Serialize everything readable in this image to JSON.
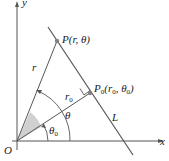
{
  "diagram": {
    "colors": {
      "line": "#555555",
      "point": "#808080",
      "shade": "#d0d0d0",
      "text": "#222222"
    },
    "axes": {
      "x_label": "x",
      "y_label": "y",
      "origin_label": "O"
    },
    "points": {
      "P": {
        "label": "P(r, θ)"
      },
      "P0": {
        "label_main": "P",
        "label_sub": "0",
        "label_rest": "(r",
        "label_sub2": "0",
        "label_mid": ", θ",
        "label_sub3": "0",
        "label_end": ")"
      }
    },
    "segments": {
      "r_label": "r",
      "r0_main": "r",
      "r0_sub": "0"
    },
    "angles": {
      "theta_label": "θ",
      "theta0_main": "θ",
      "theta0_sub": "0"
    },
    "line_label": "L"
  }
}
